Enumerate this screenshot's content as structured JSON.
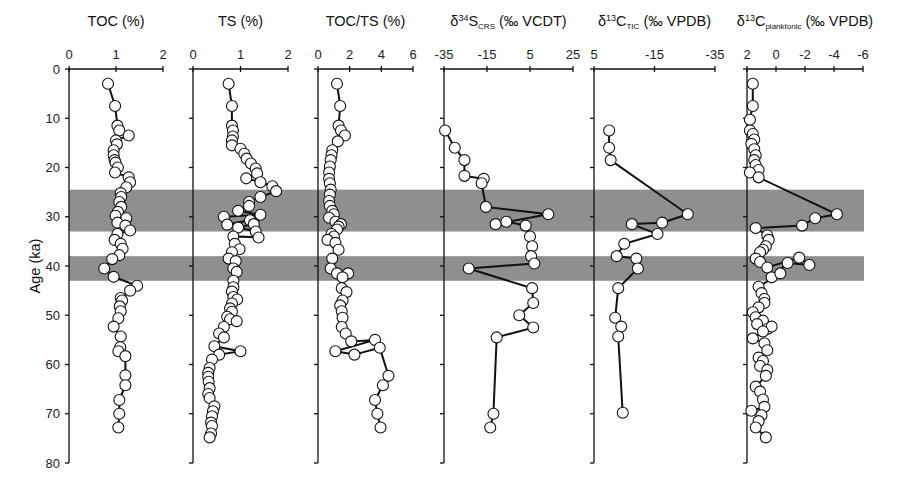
{
  "chart_data": {
    "type": "scatter",
    "subtype": "multi-panel depth/age profile (line + markers)",
    "title": "",
    "ylabel": "Age (ka)",
    "ylim": [
      0,
      80
    ],
    "y_ticks": [
      0,
      10,
      20,
      30,
      40,
      50,
      60,
      70,
      80
    ],
    "y_inverted": true,
    "grid": false,
    "legend": null,
    "shaded_intervals_ka": [
      [
        24.5,
        33
      ],
      [
        38,
        43
      ]
    ],
    "panels": [
      {
        "id": "toc",
        "title": "TOC (%)",
        "xlim": [
          0,
          2
        ],
        "x_ticks": [
          "0",
          "1",
          "2"
        ],
        "x_tick_values": [
          0,
          1,
          2
        ],
        "points": [
          [
            0.83,
            3
          ],
          [
            0.98,
            7.5
          ],
          [
            1.03,
            11.5
          ],
          [
            1.07,
            12.5
          ],
          [
            1.27,
            13.5
          ],
          [
            1.0,
            14.5
          ],
          [
            1.02,
            15.3
          ],
          [
            0.95,
            16.5
          ],
          [
            0.95,
            17.5
          ],
          [
            0.97,
            18.5
          ],
          [
            0.99,
            19
          ],
          [
            1.04,
            20
          ],
          [
            0.98,
            21
          ],
          [
            1.27,
            22
          ],
          [
            1.3,
            23
          ],
          [
            1.22,
            24
          ],
          [
            1.1,
            25.2
          ],
          [
            1.11,
            26
          ],
          [
            1.07,
            27
          ],
          [
            1.11,
            28
          ],
          [
            1.04,
            29
          ],
          [
            0.99,
            29.8
          ],
          [
            1.22,
            30.3
          ],
          [
            1.03,
            31.2
          ],
          [
            1.2,
            31.8
          ],
          [
            1.3,
            32.8
          ],
          [
            1.03,
            33.5
          ],
          [
            0.97,
            34.7
          ],
          [
            1.1,
            35.5
          ],
          [
            1.14,
            36.5
          ],
          [
            1.07,
            37.8
          ],
          [
            0.92,
            38.6
          ],
          [
            0.75,
            40.5
          ],
          [
            0.95,
            42.2
          ],
          [
            1.45,
            44
          ],
          [
            1.3,
            45
          ],
          [
            1.1,
            46.5
          ],
          [
            1.13,
            47
          ],
          [
            1.08,
            48.2
          ],
          [
            1.1,
            49.2
          ],
          [
            1.05,
            50.6
          ],
          [
            0.95,
            52.3
          ],
          [
            1.1,
            54.3
          ],
          [
            1.09,
            56.5
          ],
          [
            1.05,
            57.3
          ],
          [
            1.2,
            58.3
          ],
          [
            1.2,
            62.2
          ],
          [
            1.2,
            64.2
          ],
          [
            1.07,
            67.2
          ],
          [
            1.07,
            70
          ],
          [
            1.05,
            72.8
          ]
        ]
      },
      {
        "id": "ts",
        "title": "TS (%)",
        "xlim": [
          0,
          2
        ],
        "x_ticks": [
          "0",
          "1",
          "2"
        ],
        "x_tick_values": [
          0,
          1,
          2
        ],
        "points": [
          [
            0.75,
            3
          ],
          [
            0.82,
            7.5
          ],
          [
            0.82,
            11.5
          ],
          [
            0.84,
            12.5
          ],
          [
            0.84,
            13.7
          ],
          [
            0.82,
            14.5
          ],
          [
            0.82,
            15.5
          ],
          [
            1.0,
            16.2
          ],
          [
            1.08,
            17.2
          ],
          [
            1.13,
            18.2
          ],
          [
            1.22,
            19.2
          ],
          [
            1.32,
            20.2
          ],
          [
            1.35,
            21.2
          ],
          [
            1.12,
            22.2
          ],
          [
            1.42,
            23
          ],
          [
            1.67,
            23.8
          ],
          [
            1.75,
            24.8
          ],
          [
            1.42,
            26
          ],
          [
            1.18,
            27
          ],
          [
            1.18,
            27.8
          ],
          [
            0.95,
            28.8
          ],
          [
            1.42,
            29.6
          ],
          [
            0.65,
            30
          ],
          [
            0.72,
            31.6
          ],
          [
            1.2,
            30.7
          ],
          [
            1.28,
            31.5
          ],
          [
            0.95,
            32.2
          ],
          [
            1.32,
            33
          ],
          [
            1.38,
            34.2
          ],
          [
            0.85,
            34
          ],
          [
            0.88,
            35.5
          ],
          [
            0.98,
            36.6
          ],
          [
            0.82,
            37.2
          ],
          [
            0.75,
            38.5
          ],
          [
            0.9,
            39
          ],
          [
            0.85,
            40.5
          ],
          [
            0.92,
            41.2
          ],
          [
            0.85,
            43
          ],
          [
            0.85,
            44.3
          ],
          [
            0.82,
            45.2
          ],
          [
            0.85,
            46.3
          ],
          [
            0.93,
            46.8
          ],
          [
            0.82,
            47.6
          ],
          [
            0.78,
            48.6
          ],
          [
            0.82,
            49.3
          ],
          [
            0.72,
            50.3
          ],
          [
            0.78,
            50.8
          ],
          [
            0.92,
            51.2
          ],
          [
            0.65,
            52.4
          ],
          [
            0.55,
            53.7
          ],
          [
            0.65,
            54.5
          ],
          [
            0.45,
            56.3
          ],
          [
            1.0,
            57.3
          ],
          [
            0.55,
            58
          ],
          [
            0.4,
            59
          ],
          [
            0.35,
            60.7
          ],
          [
            0.32,
            61.7
          ],
          [
            0.32,
            62.5
          ],
          [
            0.33,
            63.5
          ],
          [
            0.35,
            64.8
          ],
          [
            0.32,
            66
          ],
          [
            0.35,
            66.8
          ],
          [
            0.45,
            68.5
          ],
          [
            0.42,
            69.5
          ],
          [
            0.4,
            70.5
          ],
          [
            0.38,
            71.8
          ],
          [
            0.4,
            72.5
          ],
          [
            0.38,
            74
          ],
          [
            0.35,
            74.8
          ]
        ]
      },
      {
        "id": "toc_ts",
        "title": "TOC/TS (%)",
        "xlim": [
          0,
          6
        ],
        "x_ticks": [
          "0",
          "2",
          "4",
          "6"
        ],
        "x_tick_values": [
          0,
          2,
          4,
          6
        ],
        "points": [
          [
            1.2,
            3
          ],
          [
            1.4,
            7.5
          ],
          [
            1.3,
            11.5
          ],
          [
            1.45,
            12.5
          ],
          [
            1.7,
            13.5
          ],
          [
            1.25,
            14.7
          ],
          [
            0.9,
            16.5
          ],
          [
            0.85,
            17.5
          ],
          [
            0.8,
            18.5
          ],
          [
            0.75,
            19.8
          ],
          [
            0.7,
            21
          ],
          [
            0.7,
            22.3
          ],
          [
            0.75,
            23.2
          ],
          [
            0.8,
            24.5
          ],
          [
            0.75,
            25.5
          ],
          [
            0.7,
            26.8
          ],
          [
            0.75,
            27.8
          ],
          [
            0.9,
            28.8
          ],
          [
            1.0,
            29.5
          ],
          [
            0.7,
            30.2
          ],
          [
            1.1,
            31
          ],
          [
            1.45,
            31.5
          ],
          [
            1.3,
            32
          ],
          [
            1.2,
            32.6
          ],
          [
            0.85,
            33.5
          ],
          [
            1.0,
            34
          ],
          [
            0.6,
            34.7
          ],
          [
            1.1,
            35.3
          ],
          [
            1.3,
            36.7
          ],
          [
            0.9,
            38.5
          ],
          [
            0.8,
            40.5
          ],
          [
            1.2,
            41.5
          ],
          [
            1.9,
            41.5
          ],
          [
            1.55,
            42.3
          ],
          [
            1.5,
            44.5
          ],
          [
            1.8,
            45.3
          ],
          [
            1.55,
            47
          ],
          [
            1.4,
            48
          ],
          [
            1.5,
            49.2
          ],
          [
            1.55,
            50.5
          ],
          [
            1.5,
            52.4
          ],
          [
            1.75,
            53.7
          ],
          [
            2.1,
            55.3
          ],
          [
            3.6,
            55
          ],
          [
            1.1,
            57.3
          ],
          [
            2.3,
            58
          ],
          [
            3.9,
            56.6
          ],
          [
            4.45,
            62.3
          ],
          [
            4.1,
            64.2
          ],
          [
            3.6,
            67.2
          ],
          [
            3.75,
            70
          ],
          [
            3.95,
            72.8
          ]
        ]
      },
      {
        "id": "d34s_crs",
        "title": "δ34S_CRS (‰ VCDT)",
        "title_parts": {
          "delta": "δ",
          "sup": "34",
          "main": "S",
          "sub": "CRS",
          "unit": "(‰ VCDT)"
        },
        "xlim": [
          -35,
          25
        ],
        "x_ticks": [
          "-35",
          "-15",
          "5",
          "25"
        ],
        "x_tick_values": [
          -35,
          -15,
          5,
          25
        ],
        "points": [
          [
            -34.5,
            12.5
          ],
          [
            -30,
            16
          ],
          [
            -25.5,
            18.5
          ],
          [
            -25.5,
            21.7
          ],
          [
            -16.5,
            22.3
          ],
          [
            -17.5,
            23.2
          ],
          [
            -15.5,
            28
          ],
          [
            13.5,
            29.5
          ],
          [
            -11,
            31.5
          ],
          [
            -6,
            31
          ],
          [
            3,
            31.8
          ],
          [
            5,
            34
          ],
          [
            6,
            36
          ],
          [
            5.5,
            38
          ],
          [
            7,
            39.5
          ],
          [
            -23.5,
            40.5
          ],
          [
            6,
            44.5
          ],
          [
            6.5,
            47.5
          ],
          [
            0,
            50
          ],
          [
            6.5,
            52.5
          ],
          [
            -10.5,
            54.5
          ],
          [
            -12,
            70
          ],
          [
            -13.5,
            72.8
          ]
        ]
      },
      {
        "id": "d13c_tic",
        "title": "δ13C_TIC (‰ VPDB)",
        "title_parts": {
          "delta": "δ",
          "sup": "13",
          "main": "C",
          "sub": "TIC",
          "unit": "(‰ VPDB)"
        },
        "xlim": [
          5,
          -35
        ],
        "x_ticks": [
          "5",
          "-15",
          "-35"
        ],
        "x_tick_values": [
          5,
          -15,
          -35
        ],
        "points": [
          [
            0,
            12.5
          ],
          [
            0,
            16
          ],
          [
            -0.5,
            18.5
          ],
          [
            -26,
            29.5
          ],
          [
            -17.5,
            31.2
          ],
          [
            -7.5,
            31.5
          ],
          [
            -16,
            33.5
          ],
          [
            -5,
            35.5
          ],
          [
            -2.5,
            38
          ],
          [
            -9,
            38.5
          ],
          [
            -9.5,
            40.5
          ],
          [
            -3,
            44.5
          ],
          [
            -2,
            50.5
          ],
          [
            -4,
            52.3
          ],
          [
            -3,
            54.3
          ],
          [
            -4.5,
            69.8
          ]
        ]
      },
      {
        "id": "d13c_planktonic",
        "title": "δ13C_planktonic (‰ VPDB)",
        "title_parts": {
          "delta": "δ",
          "sup": "13",
          "main": "C",
          "sub": "planktonic",
          "unit": "(‰ VPDB)"
        },
        "xlim": [
          2,
          -6
        ],
        "x_ticks": [
          "2",
          "0",
          "-2",
          "-4",
          "-6"
        ],
        "x_tick_values": [
          2,
          0,
          -2,
          -4,
          -6
        ],
        "points": [
          [
            1.6,
            3
          ],
          [
            1.6,
            7.5
          ],
          [
            1.8,
            10.3
          ],
          [
            1.8,
            12.5
          ],
          [
            1.6,
            13.2
          ],
          [
            1.5,
            14.3
          ],
          [
            1.7,
            15.2
          ],
          [
            1.5,
            16.3
          ],
          [
            1.4,
            17.5
          ],
          [
            1.5,
            18.5
          ],
          [
            1.4,
            19.5
          ],
          [
            1.2,
            20.5
          ],
          [
            1.8,
            21
          ],
          [
            1.2,
            22
          ],
          [
            -4.2,
            29.5
          ],
          [
            -2.7,
            30.3
          ],
          [
            -1.8,
            31.8
          ],
          [
            1.4,
            32.3
          ],
          [
            0.6,
            33.8
          ],
          [
            0.5,
            34.7
          ],
          [
            0.7,
            36
          ],
          [
            0.9,
            36.7
          ],
          [
            1.1,
            37.2
          ],
          [
            1.4,
            38.5
          ],
          [
            1.1,
            39.2
          ],
          [
            0.6,
            40.3
          ],
          [
            -1.6,
            38.3
          ],
          [
            -2.3,
            39.8
          ],
          [
            -0.8,
            39.4
          ],
          [
            0.3,
            42.3
          ],
          [
            -0.3,
            41.5
          ],
          [
            1.2,
            44.2
          ],
          [
            1.0,
            45.5
          ],
          [
            0.8,
            46.7
          ],
          [
            0.8,
            47.5
          ],
          [
            1.2,
            48.4
          ],
          [
            1.6,
            49.4
          ],
          [
            1.4,
            50.4
          ],
          [
            0.9,
            51.1
          ],
          [
            1.3,
            51.8
          ],
          [
            0.6,
            52.8
          ],
          [
            0.3,
            52.3
          ],
          [
            0.9,
            53.3
          ],
          [
            1.6,
            54.7
          ],
          [
            0.8,
            55.7
          ],
          [
            0.6,
            57.1
          ],
          [
            1.2,
            58.6
          ],
          [
            0.9,
            59.3
          ],
          [
            1.1,
            60.3
          ],
          [
            0.6,
            61.1
          ],
          [
            0.7,
            62.3
          ],
          [
            1.4,
            64.5
          ],
          [
            1.1,
            65.5
          ],
          [
            0.9,
            67.1
          ],
          [
            0.8,
            68.6
          ],
          [
            1.7,
            69.4
          ],
          [
            1.0,
            70.3
          ],
          [
            1.2,
            71.5
          ],
          [
            1.4,
            72.8
          ],
          [
            0.7,
            74.8
          ]
        ]
      }
    ]
  },
  "layout": {
    "y_axis_label": "Age (ka)",
    "y_tick_labels": [
      "0",
      "10",
      "20",
      "30",
      "40",
      "50",
      "60",
      "70",
      "80"
    ],
    "band_color": "#8f8f8f",
    "line_color": "#111111",
    "marker_fill": "#ffffff"
  }
}
